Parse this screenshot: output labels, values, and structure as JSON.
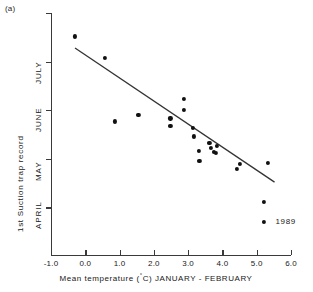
{
  "panel": {
    "label": "(a)"
  },
  "chart_data": {
    "type": "scatter",
    "title": "",
    "xlabel": "Mean temperature (°C) JANUARY - FEBRUARY",
    "ylabel": "1st Suction trap record",
    "xlim": [
      -1.0,
      6.0
    ],
    "xticks": [
      -1.0,
      0.0,
      1.0,
      2.0,
      3.0,
      4.0,
      5.0,
      6.0
    ],
    "xticklabels": [
      "-1.0",
      "0.0",
      "1.0",
      "2.0",
      "3.0",
      "4.0",
      "5.0",
      "6.0"
    ],
    "ylim": [
      0,
      5
    ],
    "yticks": [
      1,
      2,
      3,
      4,
      5
    ],
    "yticklabels": [
      "APRIL",
      "MAY",
      "JUNE",
      "JULY",
      ""
    ],
    "grid": false,
    "legend": null,
    "points": [
      {
        "x": -0.3,
        "y": 4.52
      },
      {
        "x": 0.57,
        "y": 4.08
      },
      {
        "x": 0.87,
        "y": 2.77
      },
      {
        "x": 1.55,
        "y": 2.9
      },
      {
        "x": 2.48,
        "y": 2.83
      },
      {
        "x": 2.48,
        "y": 2.68
      },
      {
        "x": 2.88,
        "y": 3.23
      },
      {
        "x": 2.88,
        "y": 3.0
      },
      {
        "x": 3.14,
        "y": 2.63
      },
      {
        "x": 3.16,
        "y": 2.46
      },
      {
        "x": 3.32,
        "y": 2.17
      },
      {
        "x": 3.33,
        "y": 1.95
      },
      {
        "x": 3.62,
        "y": 2.33
      },
      {
        "x": 3.66,
        "y": 2.22
      },
      {
        "x": 3.74,
        "y": 2.14
      },
      {
        "x": 3.8,
        "y": 2.12
      },
      {
        "x": 3.84,
        "y": 2.27
      },
      {
        "x": 4.43,
        "y": 1.8
      },
      {
        "x": 4.52,
        "y": 1.9
      },
      {
        "x": 5.32,
        "y": 1.92
      },
      {
        "x": 5.22,
        "y": 1.12
      },
      {
        "x": 5.22,
        "y": 0.7,
        "label": "1989"
      }
    ],
    "trendline": {
      "x1": -0.3,
      "y1": 4.28,
      "x2": 5.52,
      "y2": 1.52
    },
    "annotations": [
      {
        "text": "1989",
        "x": 5.55,
        "y": 0.7
      }
    ]
  }
}
